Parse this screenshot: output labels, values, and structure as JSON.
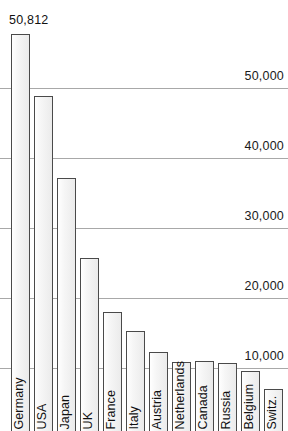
{
  "chart_data": {
    "type": "bar",
    "title": "",
    "subtitle": "",
    "xlabel": "",
    "ylabel": "",
    "categories": [
      "Germany",
      "USA",
      "Japan",
      "UK",
      "France",
      "Italy",
      "Austria",
      "Netherlands",
      "Canada",
      "Russia",
      "Belgium",
      "Switz."
    ],
    "values": [
      50812,
      38900,
      27150,
      15700,
      8000,
      5290,
      2290,
      860,
      1000,
      715,
      null,
      null
    ],
    "annotations": [
      {
        "text": "50,812",
        "category": "Germany",
        "position": "above-bar"
      }
    ],
    "y_gridlines": [
      10000,
      20000,
      30000,
      40000,
      50000
    ],
    "y_tick_labels": [
      "10,000",
      "20,000",
      "30,000",
      "40,000",
      "50,000"
    ],
    "ylim": [
      0,
      52000
    ],
    "grid": true,
    "legend": "none"
  },
  "axis": {
    "ticks": [
      {
        "label": "50,000",
        "y": 88
      },
      {
        "label": "40,000",
        "y": 158
      },
      {
        "label": "30,000",
        "y": 228
      },
      {
        "label": "20,000",
        "y": 298
      },
      {
        "label": "10,000",
        "y": 368
      }
    ]
  },
  "bars": [
    {
      "label": "Germany",
      "x": 11,
      "w": 19,
      "top": 34
    },
    {
      "label": "USA",
      "x": 34,
      "w": 19,
      "top": 96
    },
    {
      "label": "Japan",
      "x": 57,
      "w": 19,
      "top": 178
    },
    {
      "label": "UK",
      "x": 80,
      "w": 19,
      "top": 258
    },
    {
      "label": "France",
      "x": 103,
      "w": 19,
      "top": 312
    },
    {
      "label": "Italy",
      "x": 126,
      "w": 19,
      "top": 331
    },
    {
      "label": "Austria",
      "x": 149,
      "w": 19,
      "top": 352
    },
    {
      "label": "Netherlands",
      "x": 172,
      "w": 19,
      "top": 362
    },
    {
      "label": "Canada",
      "x": 195,
      "w": 19,
      "top": 361
    },
    {
      "label": "Russia",
      "x": 218,
      "w": 19,
      "top": 363
    },
    {
      "label": "Belgium",
      "x": 241,
      "w": 19,
      "top": 371
    },
    {
      "label": "Switz.",
      "x": 264,
      "w": 19,
      "top": 389
    }
  ],
  "value_label": {
    "text": "50,812",
    "x": 9,
    "y": 14
  }
}
